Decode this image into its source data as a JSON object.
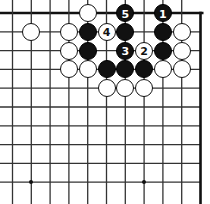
{
  "diagram": {
    "kind": "go-board-diagram",
    "board": {
      "cols": 11,
      "rows": 10,
      "origin_x": 12.5,
      "origin_y": 13.0,
      "step": 18.8,
      "line_color": "#333333",
      "edge_color": "#111111",
      "background": "#ffffff",
      "stone_radius": 9.0,
      "hoshi_radius": 2.2,
      "edges": {
        "top": true,
        "right": true,
        "left": false,
        "bottom": false
      },
      "hoshi": [
        {
          "col": 1,
          "row": 9
        },
        {
          "col": 7,
          "row": 9
        }
      ]
    },
    "stones": [
      {
        "col": 4,
        "row": 0,
        "color": "white",
        "label": ""
      },
      {
        "col": 6,
        "row": 0,
        "color": "black",
        "label": "5"
      },
      {
        "col": 8,
        "row": 0,
        "color": "black",
        "label": "1"
      },
      {
        "col": 1,
        "row": 1,
        "color": "white",
        "label": ""
      },
      {
        "col": 3,
        "row": 1,
        "color": "white",
        "label": ""
      },
      {
        "col": 4,
        "row": 1,
        "color": "black",
        "label": ""
      },
      {
        "col": 5,
        "row": 1,
        "color": "white",
        "label": "4"
      },
      {
        "col": 6,
        "row": 1,
        "color": "black",
        "label": ""
      },
      {
        "col": 8,
        "row": 1,
        "color": "black",
        "label": ""
      },
      {
        "col": 9,
        "row": 1,
        "color": "white",
        "label": ""
      },
      {
        "col": 3,
        "row": 2,
        "color": "white",
        "label": ""
      },
      {
        "col": 4,
        "row": 2,
        "color": "black",
        "label": ""
      },
      {
        "col": 6,
        "row": 2,
        "color": "black",
        "label": "3"
      },
      {
        "col": 7,
        "row": 2,
        "color": "white",
        "label": "2"
      },
      {
        "col": 8,
        "row": 2,
        "color": "black",
        "label": ""
      },
      {
        "col": 9,
        "row": 2,
        "color": "white",
        "label": ""
      },
      {
        "col": 3,
        "row": 3,
        "color": "white",
        "label": ""
      },
      {
        "col": 4,
        "row": 3,
        "color": "white",
        "label": ""
      },
      {
        "col": 5,
        "row": 3,
        "color": "black",
        "label": ""
      },
      {
        "col": 6,
        "row": 3,
        "color": "black",
        "label": ""
      },
      {
        "col": 7,
        "row": 3,
        "color": "black",
        "label": ""
      },
      {
        "col": 8,
        "row": 3,
        "color": "white",
        "label": ""
      },
      {
        "col": 9,
        "row": 3,
        "color": "white",
        "label": ""
      },
      {
        "col": 5,
        "row": 4,
        "color": "white",
        "label": ""
      },
      {
        "col": 6,
        "row": 4,
        "color": "white",
        "label": ""
      },
      {
        "col": 7,
        "row": 4,
        "color": "white",
        "label": ""
      }
    ],
    "move_labels": [
      "1",
      "2",
      "3",
      "4",
      "5"
    ]
  }
}
